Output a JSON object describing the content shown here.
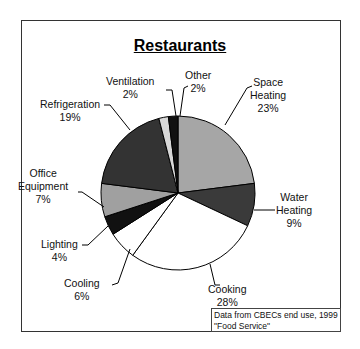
{
  "chart_data": {
    "type": "pie",
    "title": "Restaurants",
    "categories": [
      "Space Heating",
      "Water Heating",
      "Cooking",
      "Cooling",
      "Lighting",
      "Office Equipment",
      "Refrigeration",
      "Ventilation",
      "Other"
    ],
    "values": [
      23,
      9,
      28,
      6,
      4,
      7,
      19,
      2,
      2
    ],
    "unit": "%",
    "colors": [
      "#a6a6a6",
      "#3a3a3a",
      "#ffffff",
      "#ffffff",
      "#111111",
      "#a0a0a0",
      "#333333",
      "#d8d8d8",
      "#111111"
    ],
    "annotation": "Data from CBECs end use, 1999 \"Food Service\""
  },
  "labels": {
    "space_heating": {
      "name_1": "Space",
      "name_2": "Heating",
      "pct": "23%"
    },
    "water_heating": {
      "name_1": "Water",
      "name_2": "Heating",
      "pct": "9%"
    },
    "cooking": {
      "name": "Cooking",
      "pct": "28%"
    },
    "cooling": {
      "name": "Cooling",
      "pct": "6%"
    },
    "lighting": {
      "name": "Lighting",
      "pct": "4%"
    },
    "office_equipment": {
      "name_1": "Office",
      "name_2": "Equipment",
      "pct": "7%"
    },
    "refrigeration": {
      "name": "Refrigeration",
      "pct": "19%"
    },
    "ventilation": {
      "name": "Ventilation",
      "pct": "2%"
    },
    "other": {
      "name": "Other",
      "pct": "2%"
    }
  },
  "note": {
    "line1": "Data from CBECs end use, 1999",
    "line2": "\"Food Service\""
  }
}
